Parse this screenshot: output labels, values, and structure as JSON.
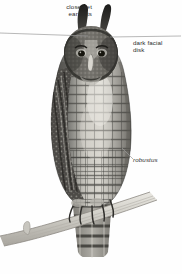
{
  "plate": {
    "subject": "eagle-owl",
    "description": "Grayscale field-guide illustration of an eagle-owl perched on a branch",
    "background_color": "#fefefe",
    "ink_color": "#2b2b2b",
    "leader_line_color": "#9a9a9a"
  },
  "labels": {
    "ear_tufts": "close-set\near tufts",
    "facial_disk": "dark facial\ndisk",
    "subspecies": "robustus"
  },
  "leader_lines": [
    {
      "name": "ear-tufts-leader",
      "x1": 0,
      "y1": 33,
      "x2": 88,
      "y2": 36
    },
    {
      "name": "facial-disk-leader",
      "x1": 110,
      "y1": 37,
      "x2": 181,
      "y2": 36
    },
    {
      "name": "robustus-leader",
      "x1": 124,
      "y1": 150,
      "x2": 133,
      "y2": 160
    }
  ]
}
